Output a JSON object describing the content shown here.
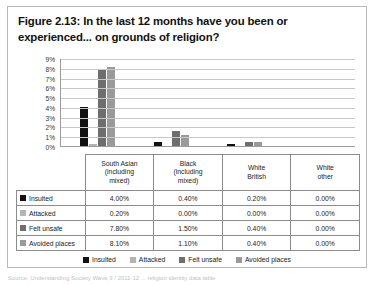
{
  "figure": {
    "title": "Figure 2.13: In the last 12 months have you been or experienced... on grounds of religion?",
    "source_caption": "Source: Understanding Society Wave 3 / 2011-12 ... religion identity data table"
  },
  "chart_data": {
    "type": "bar",
    "title": "Figure 2.13: In the last 12 months have you been or experienced... on grounds of religion?",
    "xlabel": "",
    "ylabel": "",
    "ylim": [
      0,
      9
    ],
    "grid": true,
    "legend_position": "bottom",
    "categories": [
      "South Asian (including mixed)",
      "Black (including mixed)",
      "White British",
      "White other"
    ],
    "y_ticks": [
      "0%",
      "1%",
      "2%",
      "3%",
      "4%",
      "5%",
      "6%",
      "7%",
      "8%",
      "9%"
    ],
    "series": [
      {
        "name": "Insulted",
        "color": "#111111",
        "values": [
          4.0,
          0.4,
          0.2,
          0.0
        ],
        "labels": [
          "4.00%",
          "0.40%",
          "0.20%",
          "0.00%"
        ]
      },
      {
        "name": "Attacked",
        "color": "#b4b4b4",
        "values": [
          0.2,
          0.0,
          0.0,
          0.0
        ],
        "labels": [
          "0.20%",
          "0.00%",
          "0.00%",
          "0.00%"
        ]
      },
      {
        "name": "Felt unsafe",
        "color": "#6e6e6e",
        "values": [
          7.8,
          1.5,
          0.4,
          0.0
        ],
        "labels": [
          "7.80%",
          "1.50%",
          "0.40%",
          "0.00%"
        ]
      },
      {
        "name": "Avoided places",
        "color": "#9a9a9a",
        "values": [
          8.1,
          1.1,
          0.4,
          0.0
        ],
        "labels": [
          "8.10%",
          "1.10%",
          "0.40%",
          "0.00%"
        ]
      }
    ]
  },
  "table": {
    "column_headers": [
      "South Asian (including mixed)",
      "Black (including mixed)",
      "White British",
      "White other"
    ],
    "column_header_lines": [
      [
        "South Asian",
        "(including",
        "mixed)"
      ],
      [
        "Black",
        "(including",
        "mixed)"
      ],
      [
        "White",
        "British"
      ],
      [
        "White",
        "other"
      ]
    ],
    "rows": [
      {
        "label": "Insulted",
        "values": [
          "4.00%",
          "0.40%",
          "0.20%",
          "0.00%"
        ]
      },
      {
        "label": "Attacked",
        "values": [
          "0.20%",
          "0.00%",
          "0.00%",
          "0.00%"
        ]
      },
      {
        "label": "Felt unsafe",
        "values": [
          "7.80%",
          "1.50%",
          "0.40%",
          "0.00%"
        ]
      },
      {
        "label": "Avoided places",
        "values": [
          "8.10%",
          "1.10%",
          "0.40%",
          "0.00%"
        ]
      }
    ]
  },
  "legend": {
    "items": [
      {
        "label": "Insulted",
        "color": "#111111"
      },
      {
        "label": "Attacked",
        "color": "#b4b4b4"
      },
      {
        "label": "Felt unsafe",
        "color": "#6e6e6e"
      },
      {
        "label": "Avoided places",
        "color": "#9a9a9a"
      }
    ]
  }
}
